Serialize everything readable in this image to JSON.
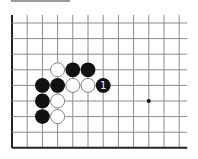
{
  "diagram": {
    "type": "go-board-fragment",
    "grid": {
      "columns": 12,
      "rows": 9,
      "origin_x": 12,
      "origin_y": 23,
      "spacing_x": 15.2,
      "spacing_y": 15.6,
      "open_top": true,
      "open_right": true,
      "left_edge": true,
      "bottom_edge": true,
      "line_color": "#8a8a8a",
      "edge_color": "#222222"
    },
    "star_points": [
      {
        "col": 9,
        "row": 5
      }
    ],
    "stones": [
      {
        "col": 3,
        "row": 3,
        "color": "white"
      },
      {
        "col": 4,
        "row": 3,
        "color": "black"
      },
      {
        "col": 5,
        "row": 3,
        "color": "black"
      },
      {
        "col": 2,
        "row": 4,
        "color": "black"
      },
      {
        "col": 3,
        "row": 4,
        "color": "black"
      },
      {
        "col": 4,
        "row": 4,
        "color": "white"
      },
      {
        "col": 5,
        "row": 4,
        "color": "white"
      },
      {
        "col": 6,
        "row": 4,
        "color": "black",
        "label": "1"
      },
      {
        "col": 2,
        "row": 5,
        "color": "black"
      },
      {
        "col": 3,
        "row": 5,
        "color": "white"
      },
      {
        "col": 2,
        "row": 6,
        "color": "black"
      },
      {
        "col": 3,
        "row": 6,
        "color": "white"
      }
    ],
    "colors": {
      "black_stone": "#111111",
      "white_stone": "#ffffff",
      "white_outline": "#777777",
      "label_on_black": "#ffffff"
    }
  }
}
